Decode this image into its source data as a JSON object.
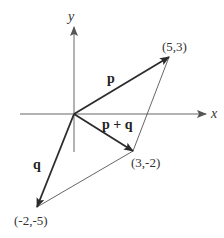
{
  "diagram": {
    "axes": {
      "x_label": "x",
      "y_label": "y"
    },
    "vectors": [
      {
        "name": "p",
        "label": "p",
        "from": [
          0,
          0
        ],
        "to": [
          5,
          3
        ]
      },
      {
        "name": "q",
        "label": "q",
        "from": [
          0,
          0
        ],
        "to": [
          -2,
          -5
        ]
      },
      {
        "name": "p_plus_q",
        "label": "p + q",
        "from": [
          0,
          0
        ],
        "to": [
          3,
          -2
        ]
      }
    ],
    "points": [
      {
        "label": "(5,3)"
      },
      {
        "label": "(3,-2)"
      },
      {
        "label": "(-2,-5)"
      }
    ],
    "parallelogram_edges": [
      {
        "from": [
          5,
          3
        ],
        "to": [
          3,
          -2
        ]
      },
      {
        "from": [
          3,
          -2
        ],
        "to": [
          -2,
          -5
        ]
      }
    ],
    "colors": {
      "vector": "#2b2b2b",
      "axis": "#555555",
      "edge": "#555555"
    }
  }
}
